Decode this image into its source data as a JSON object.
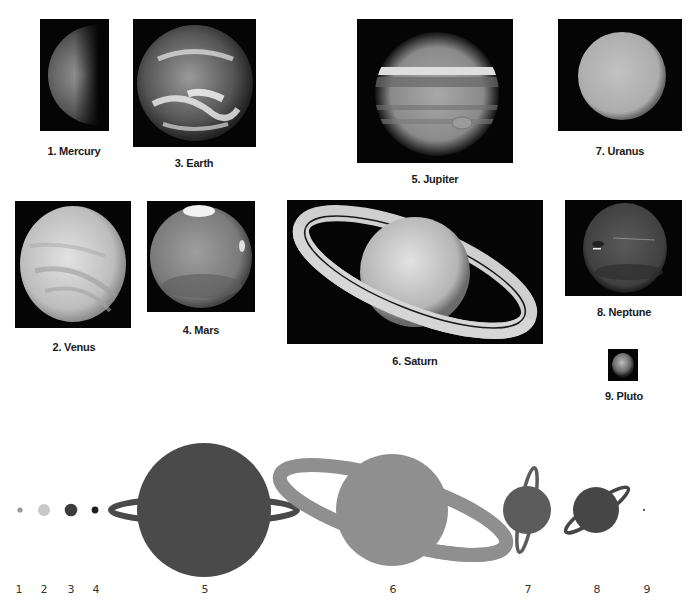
{
  "photos": [
    {
      "id": "mercury",
      "caption": "1. Mercury",
      "x": 40,
      "y": 19,
      "w": 69,
      "h": 112,
      "cap_x": 74,
      "cap_y": 145
    },
    {
      "id": "venus",
      "caption": "2. Venus",
      "x": 15,
      "y": 201,
      "w": 116,
      "h": 127,
      "cap_x": 74,
      "cap_y": 341
    },
    {
      "id": "earth",
      "caption": "3. Earth",
      "x": 133,
      "y": 19,
      "w": 123,
      "h": 128,
      "cap_x": 194,
      "cap_y": 157
    },
    {
      "id": "mars",
      "caption": "4. Mars",
      "x": 147,
      "y": 201,
      "w": 108,
      "h": 111,
      "cap_x": 201,
      "cap_y": 324
    },
    {
      "id": "jupiter",
      "caption": "5. Jupiter",
      "x": 357,
      "y": 19,
      "w": 156,
      "h": 144,
      "cap_x": 435,
      "cap_y": 173
    },
    {
      "id": "saturn",
      "caption": "6. Saturn",
      "x": 287,
      "y": 200,
      "w": 256,
      "h": 144,
      "cap_x": 415,
      "cap_y": 355
    },
    {
      "id": "uranus",
      "caption": "7. Uranus",
      "x": 558,
      "y": 19,
      "w": 124,
      "h": 112,
      "cap_x": 620,
      "cap_y": 145
    },
    {
      "id": "neptune",
      "caption": "8. Neptune",
      "x": 565,
      "y": 200,
      "w": 117,
      "h": 96,
      "cap_x": 624,
      "cap_y": 306
    },
    {
      "id": "pluto",
      "caption": "9. Pluto",
      "x": 608,
      "y": 349,
      "w": 30,
      "h": 32,
      "cap_x": 624,
      "cap_y": 390
    }
  ],
  "scale_diagram": {
    "labels": [
      "1",
      "2",
      "3",
      "4",
      "5",
      "6",
      "7",
      "8",
      "9"
    ],
    "label_x": [
      19,
      44,
      71,
      96,
      205,
      393,
      528,
      597,
      647
    ],
    "colors": {
      "mercury": "#9a9a9a",
      "venus": "#c8c8c8",
      "earth": "#3c3c3c",
      "mars": "#1e1e1e",
      "jupiter": "#4a4a4a",
      "saturn": "#8f8f8f",
      "uranus": "#5c5c5c",
      "neptune": "#464646",
      "pluto": "#333333"
    }
  }
}
